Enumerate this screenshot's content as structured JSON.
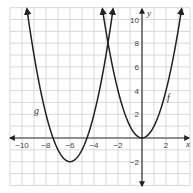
{
  "chart_data": {
    "type": "line",
    "title": "",
    "xlabel": "x",
    "ylabel": "y",
    "xlim": [
      -11,
      4
    ],
    "ylim": [
      -4,
      11
    ],
    "grid": true,
    "x_ticks": [
      -10,
      -8,
      -6,
      -4,
      -2,
      2
    ],
    "y_ticks": [
      10,
      8,
      6,
      4,
      2,
      -2
    ],
    "x_tick_labels": [
      "−10",
      "−8",
      "−6",
      "−4",
      "−2",
      "2"
    ],
    "y_tick_labels": [
      "10",
      "8",
      "6",
      "4",
      "2",
      "−2"
    ],
    "series": [
      {
        "name": "f",
        "equation": "f(x) = x^2",
        "vertex": [
          0,
          0
        ],
        "x": [
          -3.3,
          -3,
          -2,
          -1,
          0,
          1,
          2,
          3,
          3.3
        ],
        "values": [
          10.9,
          9,
          4,
          1,
          0,
          1,
          4,
          9,
          10.9
        ],
        "label_position": [
          2.2,
          3.6
        ]
      },
      {
        "name": "g",
        "equation": "g(x) = (x+6)^2 - 2",
        "vertex": [
          -6,
          -2
        ],
        "x": [
          -9.6,
          -9,
          -8,
          -7,
          -6,
          -5,
          -4,
          -3,
          -2.4
        ],
        "values": [
          10.96,
          7,
          2,
          -1,
          -2,
          -1,
          2,
          7,
          10.96
        ],
        "label_position": [
          -8.6,
          2.3
        ]
      }
    ],
    "annotations": [
      {
        "text": "f",
        "near": [
          2.2,
          3.6
        ]
      },
      {
        "text": "g",
        "near": [
          -8.6,
          2.3
        ]
      }
    ],
    "colors": {
      "curve": "#222222",
      "grid": "#cfcfcf",
      "axis": "#333333"
    }
  },
  "labels": {
    "x_axis": "x",
    "y_axis": "y",
    "f": "f",
    "g": "g",
    "xt": [
      "−10",
      "−8",
      "−6",
      "−4",
      "−2",
      "2"
    ],
    "yt": [
      "10",
      "8",
      "6",
      "4",
      "2",
      "−2"
    ]
  }
}
